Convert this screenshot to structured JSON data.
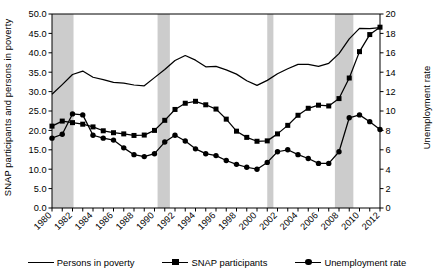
{
  "chart_data": {
    "type": "line",
    "title": "",
    "xlabel": "",
    "ylabel": "SNAP participants and persons in poverty",
    "ylabel_right": "Unemployment rate",
    "x": [
      1980,
      1981,
      1982,
      1983,
      1984,
      1985,
      1986,
      1987,
      1988,
      1989,
      1990,
      1991,
      1992,
      1993,
      1994,
      1995,
      1996,
      1997,
      1998,
      1999,
      2000,
      2001,
      2002,
      2003,
      2004,
      2005,
      2006,
      2007,
      2008,
      2009,
      2010,
      2011,
      2012
    ],
    "xtick_labels": [
      "1980",
      "1982",
      "1984",
      "1986",
      "1988",
      "1990",
      "1992",
      "1994",
      "1996",
      "1998",
      "2000",
      "2002",
      "2004",
      "2006",
      "2008",
      "2010",
      "2012"
    ],
    "ylim": [
      0,
      50
    ],
    "ytick_labels": [
      "0.0",
      "5.0",
      "10.0",
      "15.0",
      "20.0",
      "25.0",
      "30.0",
      "35.0",
      "40.0",
      "45.0",
      "50.0"
    ],
    "ylim_right": [
      0,
      20
    ],
    "ytick_labels_right": [
      "0",
      "2",
      "4",
      "6",
      "8",
      "10",
      "12",
      "14",
      "16",
      "18",
      "20"
    ],
    "grid": false,
    "legend_position": "bottom",
    "series": [
      {
        "name": "Persons in poverty",
        "axis": "left",
        "marker": "none",
        "values": [
          29.3,
          31.8,
          34.4,
          35.3,
          33.7,
          33.1,
          32.4,
          32.2,
          31.7,
          31.5,
          33.6,
          35.7,
          38.0,
          39.3,
          38.1,
          36.4,
          36.5,
          35.6,
          34.5,
          32.8,
          31.6,
          32.9,
          34.6,
          35.9,
          37.0,
          37.0,
          36.5,
          37.3,
          39.8,
          43.6,
          46.3,
          46.2,
          46.5
        ]
      },
      {
        "name": "SNAP participants",
        "axis": "left",
        "marker": "square",
        "values": [
          21.1,
          22.4,
          22.0,
          21.6,
          20.9,
          19.9,
          19.4,
          19.1,
          18.7,
          18.8,
          20.0,
          22.6,
          25.4,
          27.0,
          27.5,
          26.6,
          25.5,
          22.9,
          19.8,
          18.2,
          17.2,
          17.3,
          19.1,
          21.3,
          23.9,
          25.7,
          26.5,
          26.3,
          28.2,
          33.5,
          40.3,
          44.7,
          46.6
        ]
      },
      {
        "name": "Unemployment rate",
        "axis": "right",
        "marker": "circle",
        "values": [
          7.2,
          7.6,
          9.7,
          9.6,
          7.5,
          7.2,
          7.0,
          6.2,
          5.5,
          5.3,
          5.6,
          6.8,
          7.5,
          6.9,
          6.1,
          5.6,
          5.4,
          4.9,
          4.5,
          4.2,
          4.0,
          4.7,
          5.8,
          6.0,
          5.5,
          5.1,
          4.6,
          4.6,
          5.8,
          9.3,
          9.6,
          8.9,
          8.1
        ]
      }
    ],
    "recession_bands": [
      {
        "start": 1980.0,
        "end": 1982.1
      },
      {
        "start": 1990.3,
        "end": 1991.5
      },
      {
        "start": 2001.0,
        "end": 2001.6
      },
      {
        "start": 2007.6,
        "end": 2009.4
      }
    ],
    "recession_band_color": "#cccccc",
    "line_color": "#000000"
  },
  "legend": {
    "items": [
      {
        "label": "Persons in poverty",
        "marker": "line"
      },
      {
        "label": "SNAP participants",
        "marker": "square"
      },
      {
        "label": "Unemployment rate",
        "marker": "circle"
      }
    ]
  }
}
